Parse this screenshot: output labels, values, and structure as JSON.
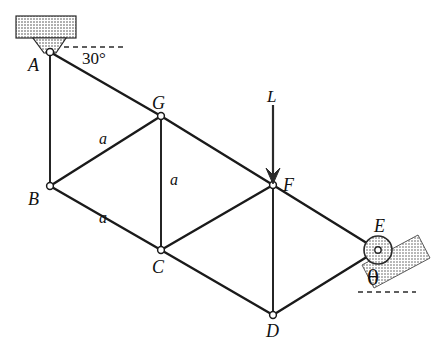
{
  "figure": {
    "type": "engineering-statics-truss",
    "background_color": "#ffffff",
    "line_color": "#1a1a1a",
    "hatch_color": "#9a9a9a"
  },
  "nodes": [
    {
      "id": "A",
      "label": "A",
      "x": 50,
      "y": 52,
      "label_x": 28,
      "label_y": 56,
      "support": "pin"
    },
    {
      "id": "B",
      "label": "B",
      "x": 50,
      "y": 186,
      "label_x": 28,
      "label_y": 190,
      "support": "none"
    },
    {
      "id": "G",
      "label": "G",
      "x": 161,
      "y": 116,
      "label_x": 152,
      "label_y": 96,
      "support": "none"
    },
    {
      "id": "C",
      "label": "C",
      "x": 161,
      "y": 250,
      "label_x": 152,
      "label_y": 262,
      "support": "none"
    },
    {
      "id": "F",
      "label": "F",
      "x": 273,
      "y": 185,
      "label_x": 283,
      "label_y": 178,
      "support": "none"
    },
    {
      "id": "D",
      "label": "D",
      "x": 273,
      "y": 315,
      "label_x": 266,
      "label_y": 325,
      "support": "none"
    },
    {
      "id": "E",
      "label": "E",
      "x": 378,
      "y": 250,
      "label_x": 374,
      "label_y": 222,
      "support": "roller-on-incline"
    }
  ],
  "members": [
    {
      "from": "A",
      "to": "B"
    },
    {
      "from": "A",
      "to": "G"
    },
    {
      "from": "B",
      "to": "G"
    },
    {
      "from": "B",
      "to": "C"
    },
    {
      "from": "G",
      "to": "C"
    },
    {
      "from": "G",
      "to": "F"
    },
    {
      "from": "C",
      "to": "F"
    },
    {
      "from": "C",
      "to": "D"
    },
    {
      "from": "F",
      "to": "D"
    },
    {
      "from": "F",
      "to": "E"
    },
    {
      "from": "D",
      "to": "E"
    }
  ],
  "dimension_labels": [
    {
      "text": "a",
      "member": "B-G",
      "x": 99,
      "y": 133
    },
    {
      "text": "a",
      "member": "G-C",
      "x": 170,
      "y": 174
    },
    {
      "text": "a",
      "member": "B-C",
      "x": 99,
      "y": 212
    }
  ],
  "angles": [
    {
      "text": "30°",
      "at_node": "A",
      "x": 82,
      "y": 51,
      "reference": "horizontal-dashed"
    },
    {
      "text": "θ",
      "at_node": "E",
      "x": 367,
      "y": 272,
      "reference": "horizontal-dashed"
    }
  ],
  "load": {
    "label": "L",
    "label_x": 267,
    "label_y": 90,
    "direction": "down",
    "applied_at": "F",
    "arrow_from_x": 273,
    "arrow_from_y": 105,
    "arrow_to_x": 273,
    "arrow_to_y": 183
  },
  "supports": {
    "ceiling_block": {
      "name": "hatched-ceiling-block",
      "x": 16,
      "y": 16,
      "width": 60,
      "height": 22
    },
    "pin_bracket": {
      "name": "pin-support-bracket",
      "apex_x": 50,
      "apex_y": 52
    },
    "incline_block": {
      "name": "hatched-inclined-surface",
      "angle_deg": 28
    },
    "roller": {
      "name": "roller-circle",
      "cx": 378,
      "cy": 250,
      "r": 14
    }
  }
}
